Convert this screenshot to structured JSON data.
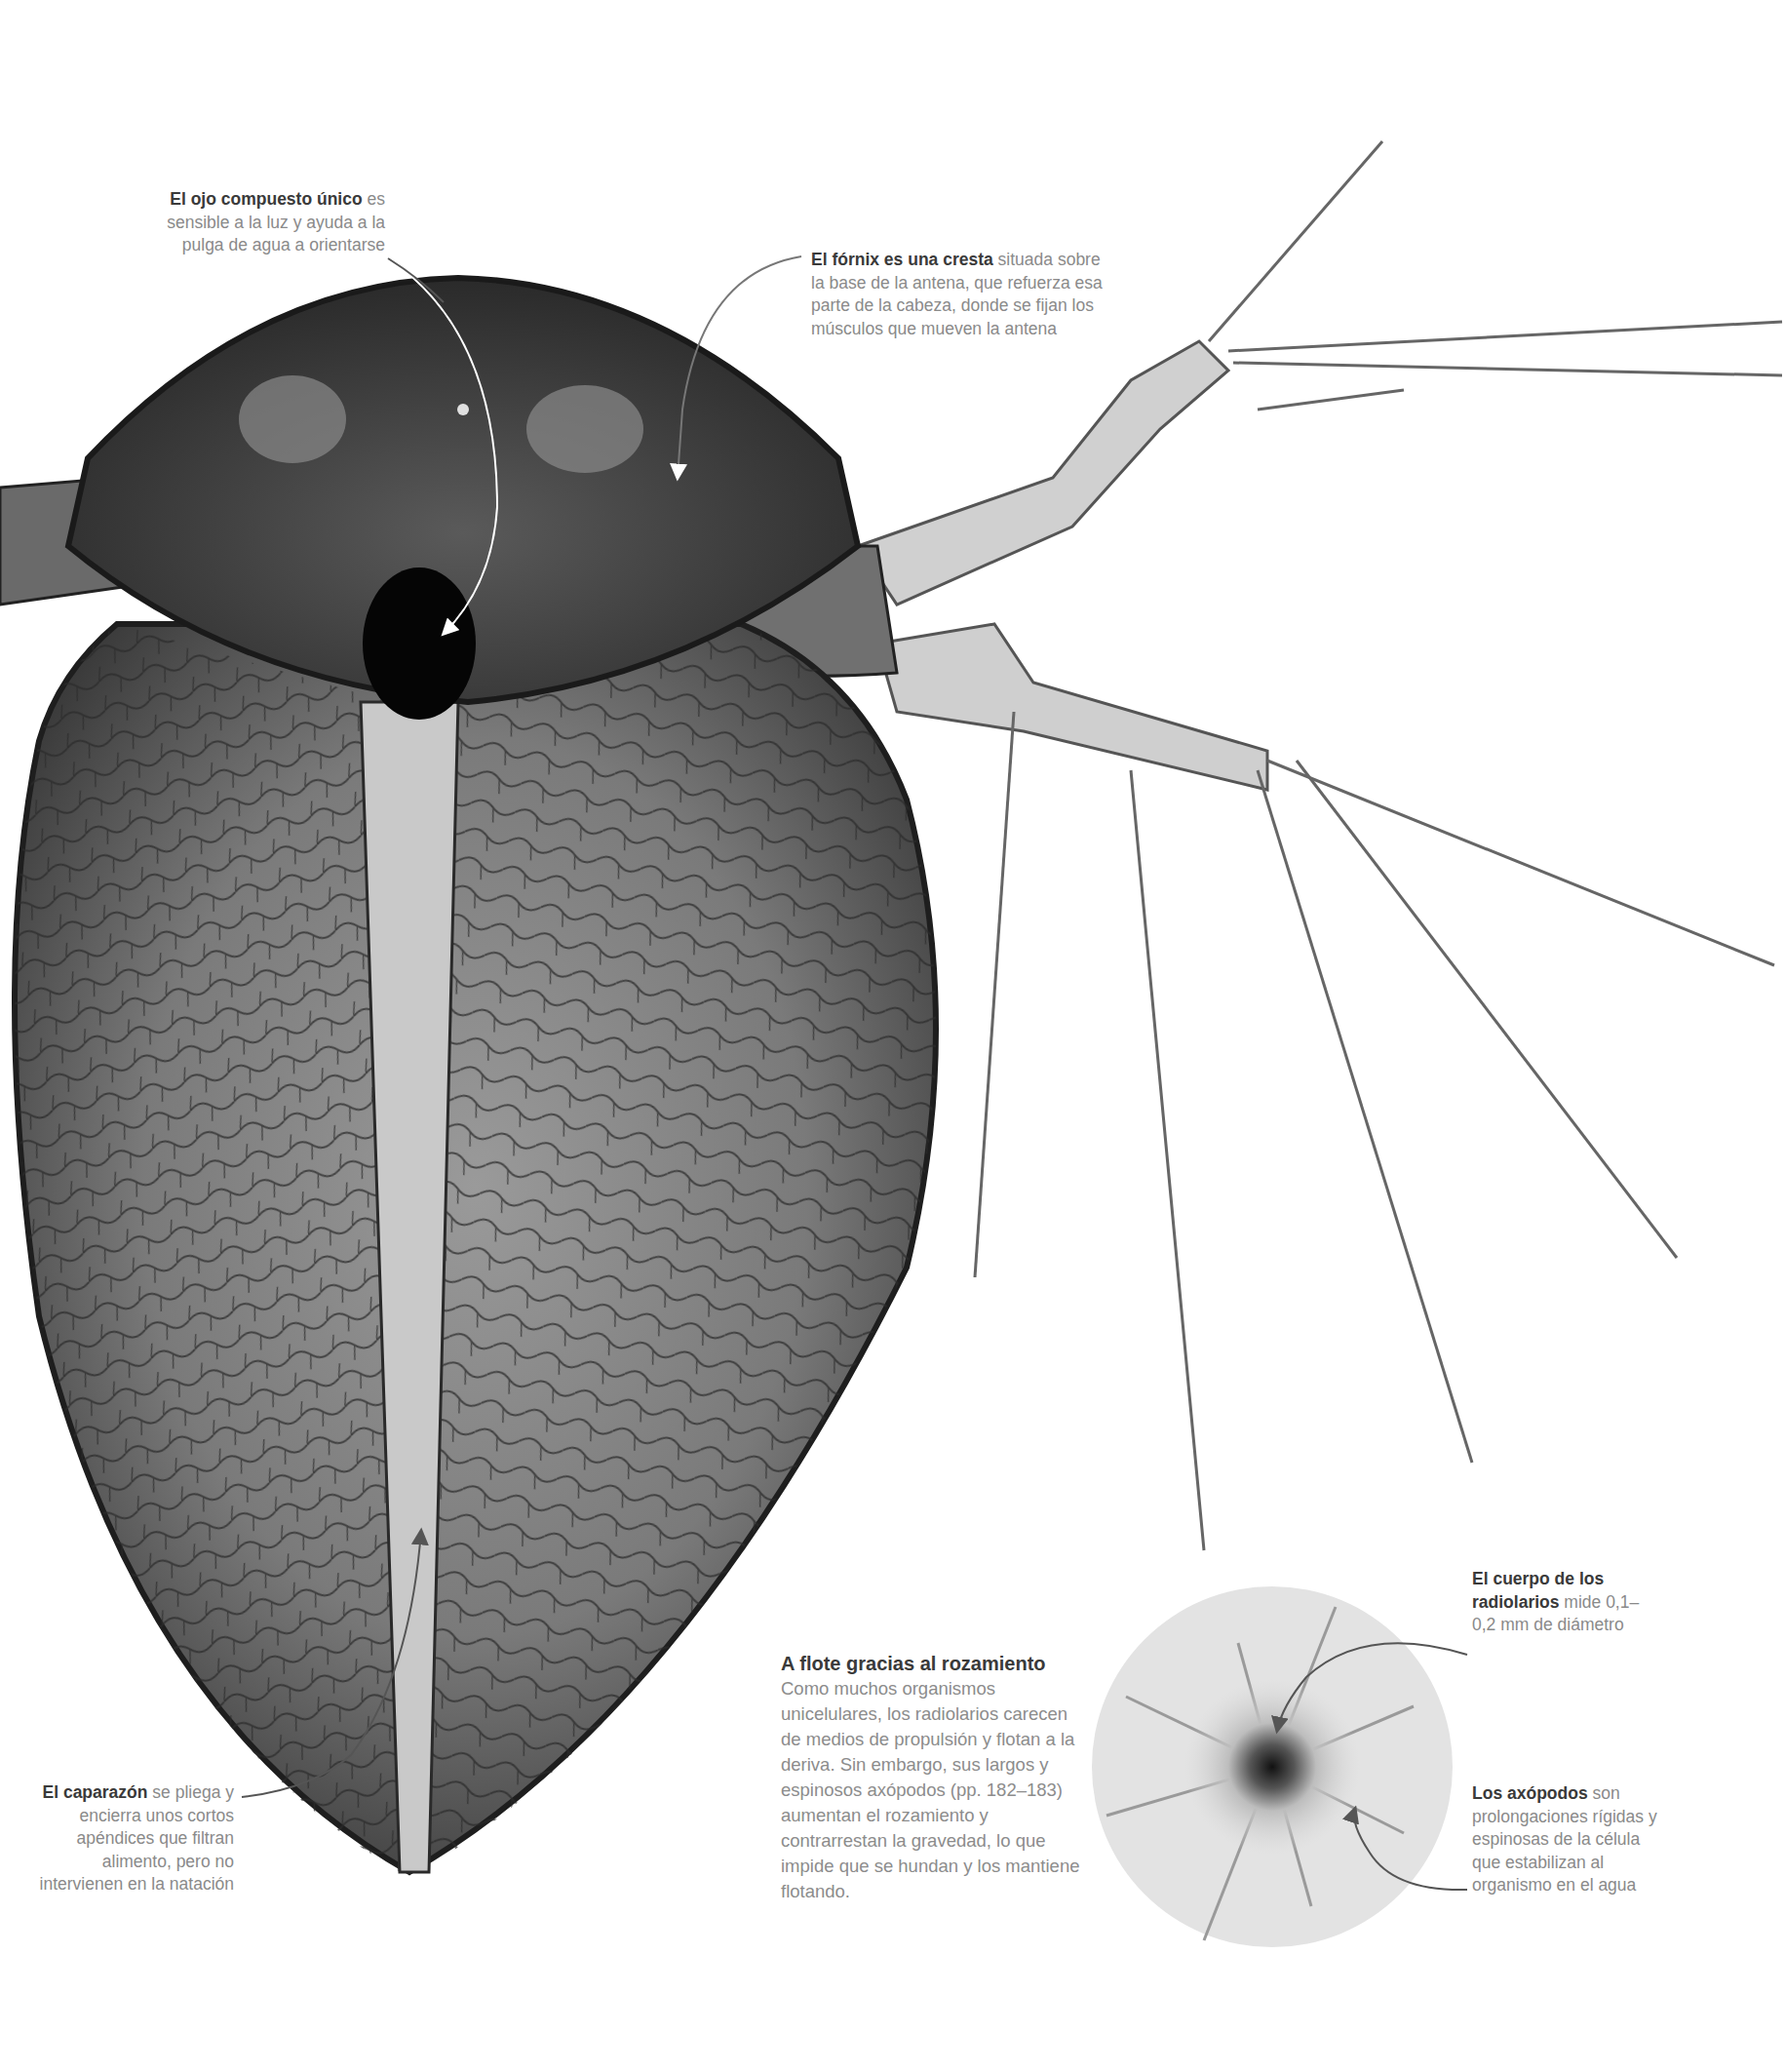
{
  "page": {
    "colors": {
      "background": "#ffffff",
      "caption_bold": "#3a3a3a",
      "caption_text": "#8a8a8a",
      "leader_line": "#666666",
      "radiolarian_disc": "#e4e4e4"
    }
  },
  "annotations": {
    "eye": {
      "bold": "El ojo compuesto único",
      "text": " es sensible a la luz y ayuda a la pulga de agua a orientarse"
    },
    "fornix": {
      "bold": "El fórnix es una cresta",
      "text": " situada sobre la base de la antena, que refuerza esa parte de la cabeza, donde se fijan los músculos que mueven la antena"
    },
    "carapace": {
      "bold": "El caparazón",
      "text": " se pliega y encierra unos cortos apéndices que filtran alimento, pero no intervienen en la natación"
    },
    "radiolarian_body": {
      "bold": "El cuerpo de los radiolarios",
      "text": " mide 0,1–0,2 mm de diámetro"
    },
    "axopods": {
      "bold": "Los axópodos",
      "text": " son prolongaciones rígidas y espinosas de la célula que estabilizan al organismo en el agua"
    }
  },
  "sidebar": {
    "title": "A flote gracias al rozamiento",
    "body": "Como muchos organismos unicelulares, los radiolarios carecen de medios de propulsión y flotan a la deriva. Sin embargo, sus largos y espinosos axópodos (pp. 182–183) aumentan el rozamiento y contrarrestan la gravedad, lo que impide que se hundan y los mantiene flotando."
  }
}
